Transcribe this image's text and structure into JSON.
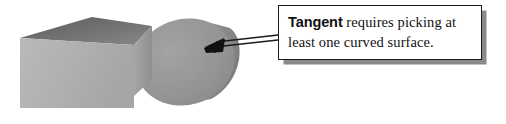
{
  "figure": {
    "caption_box": {
      "term": "Tangent",
      "body": " requires picking at least one curved surface."
    },
    "shapes": [
      {
        "name": "rectangular-block",
        "label": "3D box solid"
      },
      {
        "name": "cylinder",
        "label": "cylinder solid with curved surface"
      }
    ],
    "annotation": {
      "name": "pointer-arrow",
      "label": "arrow from callout to cylinder curved face"
    },
    "colors": {
      "block_front": "#b5b5b5",
      "block_top": "#6e6e6e",
      "block_side": "#a0a0a0",
      "cylinder_face": "#969696",
      "cylinder_body": "#8c8c8c",
      "outline": "#1c1c1c",
      "shadow": "#8a8a8a",
      "background": "#ffffff"
    }
  }
}
